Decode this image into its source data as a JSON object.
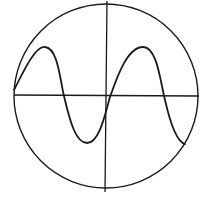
{
  "diagram": {
    "type": "oscilloscope-trace",
    "colors": {
      "stroke": "#1a1a1a",
      "background": "#ffffff"
    },
    "screen": {
      "cx": 106,
      "cy": 96,
      "r": 92
    },
    "axes": {
      "horizontal": {
        "x1": 14,
        "y1": 95,
        "x2": 199,
        "y2": 96
      },
      "vertical": {
        "x1": 107,
        "y1": 1,
        "x2": 105,
        "y2": 192
      }
    },
    "waveform": {
      "shape": "sine",
      "path": "M14,90 C26,66 36,46 45,47 C58,48 60,80 64,96 C70,122 76,143 87,143 C100,143 106,110 110,97 C118,74 128,47 143,47 C157,47 160,80 165,100 C170,122 177,142 185,144"
    }
  }
}
